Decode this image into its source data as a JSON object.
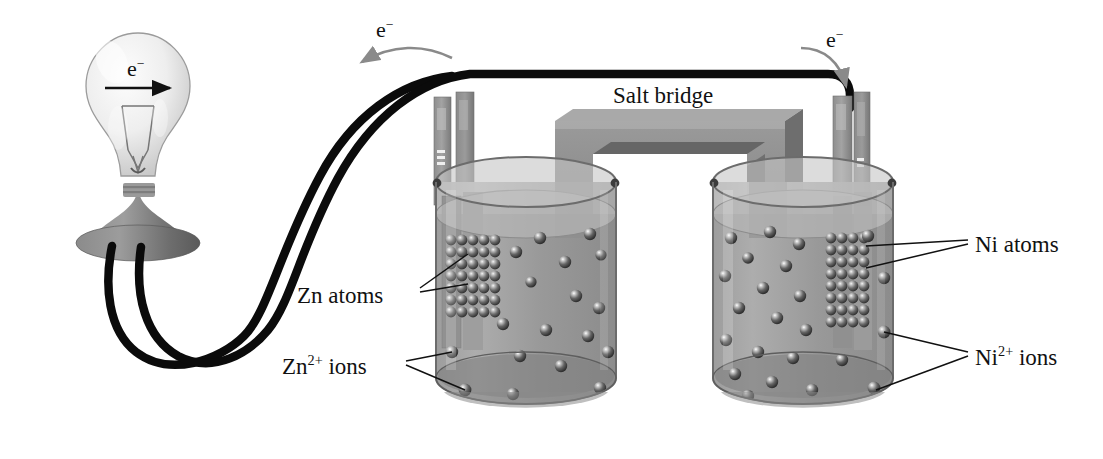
{
  "figure": {
    "background": "#ffffff"
  },
  "labels": {
    "zn_atoms": "Zn atoms",
    "zn_ions_base": "Zn",
    "zn_ions_sup": "2+",
    "zn_ions_tail": " ions",
    "ni_atoms": "Ni atoms",
    "ni_ions_base": "Ni",
    "ni_ions_sup": "2+",
    "ni_ions_tail": " ions",
    "salt_bridge": "Salt bridge",
    "electron_bulb_base": "e",
    "electron_bulb_sup": "−",
    "electron_left_base": "e",
    "electron_left_sup": "−",
    "electron_right_base": "e",
    "electron_right_sup": "−"
  },
  "colors": {
    "wire": "#0b0b0b",
    "glass": "#e8e8e8",
    "base_dark": "#6f6f6f",
    "electrode": "#8f8f8f",
    "electrode_shadow": "#6b6b6b",
    "solution": "#9a9a9a",
    "beaker_glass": "#b3b3b3",
    "sphere": "#555555",
    "sphere_highlight": "#f2f2f2",
    "salt_bridge_face": "#8a8a8a",
    "salt_bridge_top": "#a8a8a8",
    "arrow_gray": "#888888",
    "leader": "#111111"
  },
  "cells": {
    "left": {
      "electrode_label": "Zn electrode",
      "atom_grid": {
        "cols": 5,
        "rows": 7
      },
      "ion_count": 18
    },
    "right": {
      "electrode_label": "Ni electrode",
      "atom_grid": {
        "cols": 4,
        "rows": 8
      },
      "ion_count": 23
    }
  },
  "bulb": {
    "name": "light bulb",
    "arrow_direction": "right"
  },
  "salt_bridge": {
    "name": "salt bridge tube",
    "shape": "inverted-U"
  }
}
